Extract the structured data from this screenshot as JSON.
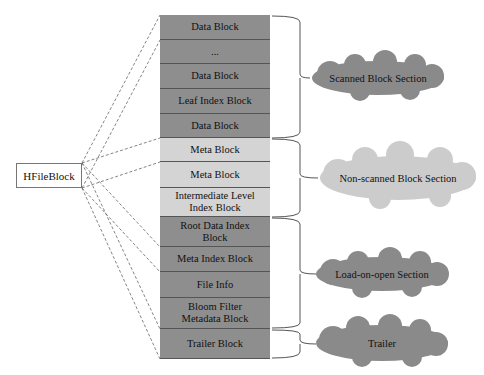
{
  "hfile_block": {
    "label": "HFileBlock"
  },
  "colors": {
    "dark": "#8e8e8e",
    "light": "#d4d4d4",
    "cloud_dark": "#8a8a8a",
    "cloud_light": "#cccccc"
  },
  "blocks": [
    {
      "label": "Data Block",
      "top": 0,
      "height": 25,
      "shade": "dark"
    },
    {
      "label": "...",
      "top": 25,
      "height": 24,
      "shade": "dark"
    },
    {
      "label": "Data Block",
      "top": 49,
      "height": 25,
      "shade": "dark"
    },
    {
      "label": "Leaf Index Block",
      "top": 74,
      "height": 25,
      "shade": "dark"
    },
    {
      "label": "Data Block",
      "top": 99,
      "height": 24,
      "shade": "dark"
    },
    {
      "label": "Meta Block",
      "top": 123,
      "height": 24,
      "shade": "light"
    },
    {
      "label": "Meta Block",
      "top": 147,
      "height": 26,
      "shade": "light"
    },
    {
      "label": "Intermediate Level Index Block",
      "top": 173,
      "height": 29,
      "shade": "light"
    },
    {
      "label": "Root Data Index Block",
      "top": 202,
      "height": 30,
      "shade": "dark"
    },
    {
      "label": "Meta Index Block",
      "top": 232,
      "height": 25,
      "shade": "dark"
    },
    {
      "label": "File Info",
      "top": 257,
      "height": 26,
      "shade": "dark"
    },
    {
      "label": "Bloom Filter Metadata Block",
      "top": 283,
      "height": 31,
      "shade": "dark"
    },
    {
      "label": "Trailer  Block",
      "top": 314,
      "height": 30,
      "shade": "dark"
    }
  ],
  "sections": [
    {
      "label": "Scanned Block Section",
      "shade": "dark"
    },
    {
      "label": "Non-scanned Block Section",
      "shade": "light"
    },
    {
      "label": "Load-on-open Section",
      "shade": "dark"
    },
    {
      "label": "Trailer",
      "shade": "dark"
    }
  ]
}
